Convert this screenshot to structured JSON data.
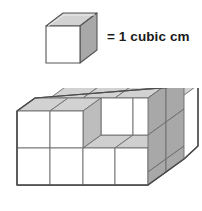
{
  "figure": {
    "kind": "isometric-unit-cube-volume-diagram",
    "background_color": "#ffffff"
  },
  "legend": {
    "cube_name": "unit-cube",
    "equals_text": "= 1 cubic cm",
    "unit": "cubic cm",
    "quantity": 1
  },
  "palette": {
    "face_front": "#ffffff",
    "face_top": "#d2d2d2",
    "face_right": "#a8a8a8",
    "face_inner_floor": "#cfcfcf",
    "face_inner_side": "#bdbdbd",
    "outline": "#555555",
    "outline_light": "#777777",
    "text": "#1a1a1a"
  },
  "solid": {
    "name": "stacked-cube-solid",
    "width_cubes": 4,
    "height_cubes": 2,
    "depth_cubes": 2,
    "full_block_cubes": 16,
    "missing_cubes": 2,
    "total_cubes": 14,
    "notch_description": "two unit cubes removed from the top layer at the front-right",
    "front_face_columns": 4,
    "front_face_rows": 2,
    "left_face_columns": 2,
    "left_face_rows": 2,
    "top_face_columns": 4,
    "top_face_rows": 2
  },
  "geometry": {
    "legend_cube": {
      "front": "46,26 46,63 80,63 80,26",
      "top": "46,26 63,13 97,13 80,26",
      "right": "80,26 97,13 97,50 80,63"
    },
    "solid_outline": "17,126 17,200 148,200 148,188 184,163 184,100 150,100 150,98 100,98 100,110 83,110 83,98 50,98 17,126",
    "labels": {
      "legend_cube_label": "unit cube icon",
      "solid_label": "composite solid made of unit cubes"
    }
  }
}
